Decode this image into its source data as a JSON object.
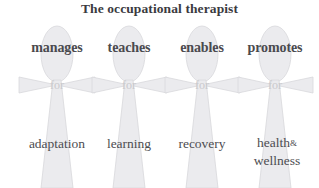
{
  "diagram": {
    "title": "The occupational therapist",
    "connector_label": "for",
    "figure_icon": "cross-figure-icon",
    "columns": [
      {
        "verb": "manages",
        "connector": "for",
        "outcome": "adaptation",
        "outcome_lines": [
          "adaptation"
        ]
      },
      {
        "verb": "teaches",
        "connector": "for",
        "outcome": "learning",
        "outcome_lines": [
          "learning"
        ]
      },
      {
        "verb": "enables",
        "connector": "for",
        "outcome": "recovery",
        "outcome_lines": [
          "recovery"
        ]
      },
      {
        "verb": "promotes",
        "connector": "for",
        "outcome": "health & wellness",
        "outcome_lines": [
          "health",
          "&",
          "wellness"
        ]
      }
    ]
  },
  "colors": {
    "background": "#ffffff",
    "title_text": "#3b3b3f",
    "verb_text": "#4a4a4e",
    "outcome_text": "#4d4d51",
    "connector_text": "#c9c9cc",
    "figure_fill": "#ebebee",
    "figure_stroke": "#d6d6da"
  }
}
